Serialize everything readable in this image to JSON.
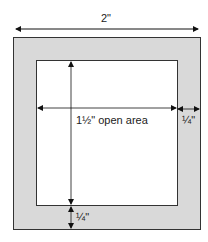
{
  "diagram": {
    "outer_width_label": "2\"",
    "open_area_label": "1½\" open area",
    "border_right_label": "¼\"",
    "border_bottom_label": "¼\"",
    "colors": {
      "frame": "#d9d9d9",
      "stroke": "#333333",
      "open": "#ffffff"
    }
  }
}
